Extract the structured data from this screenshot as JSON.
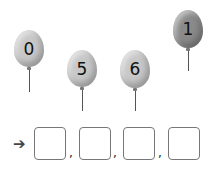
{
  "balloons": [
    {
      "label": "0",
      "color": "#c8c8c8"
    },
    {
      "label": "5",
      "color": "#c8c8c8"
    },
    {
      "label": "6",
      "color": "#c8c8c8"
    },
    {
      "label": "1",
      "color": "#8a8a8a"
    }
  ],
  "answer": {
    "arrow": "➔",
    "separator": ",",
    "boxes": [
      "",
      "",
      "",
      ""
    ]
  }
}
